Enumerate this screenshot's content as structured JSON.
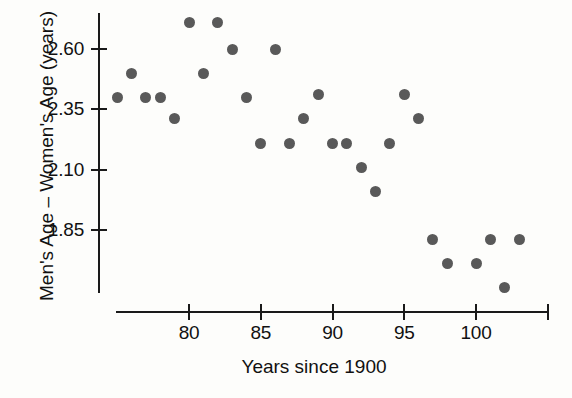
{
  "chart_data": {
    "type": "scatter",
    "title": "",
    "xlabel": "Years since 1900",
    "ylabel": "Men's Age – Women's Age (years)",
    "xlim": [
      74,
      104
    ],
    "ylim": [
      1.55,
      2.78
    ],
    "xticks": [
      80,
      85,
      90,
      95,
      100
    ],
    "yticks": [
      2.6,
      2.35,
      2.1,
      1.85
    ],
    "xtick_labels": [
      "80",
      "85",
      "90",
      "95",
      "100"
    ],
    "ytick_labels": [
      "2.60",
      "2.35",
      "2.10",
      "1.85"
    ],
    "grid": false,
    "legend": false,
    "marker_color": "#595959",
    "axis_color": "#1a1a1a",
    "x": [
      75,
      76,
      77,
      78,
      79,
      80,
      81,
      82,
      83,
      84,
      85,
      86,
      87,
      88,
      89,
      90,
      91,
      92,
      93,
      94,
      95,
      96,
      97,
      98,
      100,
      101,
      102,
      103
    ],
    "y": [
      2.4,
      2.5,
      2.4,
      2.4,
      2.31,
      2.71,
      2.5,
      2.71,
      2.6,
      2.4,
      2.21,
      2.6,
      2.21,
      2.31,
      2.41,
      2.21,
      2.21,
      2.11,
      2.01,
      2.21,
      2.41,
      2.31,
      1.81,
      1.71,
      1.71,
      1.81,
      1.61,
      1.81
    ]
  },
  "axes": {
    "xlabel": "Years since 1900",
    "ylabel": "Men's Age – Women's Age (years)"
  }
}
